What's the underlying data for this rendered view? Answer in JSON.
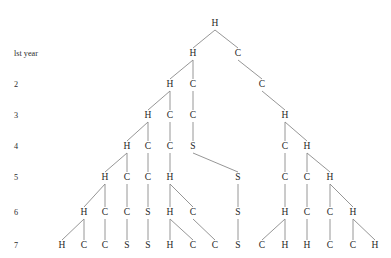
{
  "figure": {
    "type": "tree-diagram",
    "title": "",
    "width": 391,
    "height": 258,
    "background_color": "#ffffff",
    "edge_color": "#8a8a8a",
    "node_text_color": "#262626",
    "label_text_color": "#2b2b2b"
  },
  "row_labels": [
    {
      "text": "lst year",
      "x": 14,
      "y": 54
    },
    {
      "text": "2",
      "x": 14,
      "y": 85
    },
    {
      "text": "3",
      "x": 14,
      "y": 116
    },
    {
      "text": "4",
      "x": 14,
      "y": 147
    },
    {
      "text": "5",
      "x": 14,
      "y": 178
    },
    {
      "text": "6",
      "x": 14,
      "y": 213
    },
    {
      "text": "7",
      "x": 14,
      "y": 246
    }
  ],
  "rows": [
    {
      "level": 0,
      "y": 24
    },
    {
      "level": 1,
      "y": 54
    },
    {
      "level": 2,
      "y": 85
    },
    {
      "level": 3,
      "y": 116
    },
    {
      "level": 4,
      "y": 147
    },
    {
      "level": 5,
      "y": 178
    },
    {
      "level": 6,
      "y": 213
    },
    {
      "level": 7,
      "y": 246
    }
  ],
  "nodes": [
    {
      "id": "n0",
      "label": "H",
      "x": 215,
      "y": 24
    },
    {
      "id": "n1a",
      "label": "H",
      "x": 193,
      "y": 54
    },
    {
      "id": "n1b",
      "label": "C",
      "x": 238,
      "y": 54
    },
    {
      "id": "n2a",
      "label": "H",
      "x": 170,
      "y": 85
    },
    {
      "id": "n2b",
      "label": "C",
      "x": 193,
      "y": 85
    },
    {
      "id": "n2c",
      "label": "C",
      "x": 262,
      "y": 85
    },
    {
      "id": "n3a",
      "label": "H",
      "x": 148,
      "y": 116
    },
    {
      "id": "n3b",
      "label": "C",
      "x": 170,
      "y": 116
    },
    {
      "id": "n3c",
      "label": "C",
      "x": 193,
      "y": 116
    },
    {
      "id": "n3d",
      "label": "H",
      "x": 285,
      "y": 116
    },
    {
      "id": "n4a",
      "label": "H",
      "x": 127,
      "y": 147
    },
    {
      "id": "n4b",
      "label": "C",
      "x": 148,
      "y": 147
    },
    {
      "id": "n4c",
      "label": "C",
      "x": 170,
      "y": 147
    },
    {
      "id": "n4d",
      "label": "S",
      "x": 193,
      "y": 147
    },
    {
      "id": "n4e",
      "label": "C",
      "x": 285,
      "y": 147
    },
    {
      "id": "n4f",
      "label": "H",
      "x": 307,
      "y": 147
    },
    {
      "id": "n5a",
      "label": "H",
      "x": 105,
      "y": 178
    },
    {
      "id": "n5b",
      "label": "C",
      "x": 127,
      "y": 178
    },
    {
      "id": "n5c",
      "label": "C",
      "x": 148,
      "y": 178
    },
    {
      "id": "n5d",
      "label": "H",
      "x": 170,
      "y": 178
    },
    {
      "id": "n5e",
      "label": "S",
      "x": 238,
      "y": 178
    },
    {
      "id": "n5f",
      "label": "C",
      "x": 285,
      "y": 178
    },
    {
      "id": "n5g",
      "label": "C",
      "x": 307,
      "y": 178
    },
    {
      "id": "n5h",
      "label": "H",
      "x": 330,
      "y": 178
    },
    {
      "id": "n6a",
      "label": "H",
      "x": 84,
      "y": 213
    },
    {
      "id": "n6b",
      "label": "C",
      "x": 105,
      "y": 213
    },
    {
      "id": "n6c",
      "label": "C",
      "x": 127,
      "y": 213
    },
    {
      "id": "n6d",
      "label": "S",
      "x": 148,
      "y": 213
    },
    {
      "id": "n6e",
      "label": "H",
      "x": 170,
      "y": 213
    },
    {
      "id": "n6f",
      "label": "C",
      "x": 193,
      "y": 213
    },
    {
      "id": "n6g",
      "label": "S",
      "x": 238,
      "y": 213
    },
    {
      "id": "n6h",
      "label": "H",
      "x": 285,
      "y": 213
    },
    {
      "id": "n6i",
      "label": "C",
      "x": 307,
      "y": 213
    },
    {
      "id": "n6j",
      "label": "C",
      "x": 330,
      "y": 213
    },
    {
      "id": "n6k",
      "label": "H",
      "x": 353,
      "y": 213
    },
    {
      "id": "n7a",
      "label": "H",
      "x": 62,
      "y": 246
    },
    {
      "id": "n7b",
      "label": "C",
      "x": 84,
      "y": 246
    },
    {
      "id": "n7c",
      "label": "C",
      "x": 105,
      "y": 246
    },
    {
      "id": "n7d",
      "label": "S",
      "x": 127,
      "y": 246
    },
    {
      "id": "n7e",
      "label": "S",
      "x": 148,
      "y": 246
    },
    {
      "id": "n7f",
      "label": "H",
      "x": 170,
      "y": 246
    },
    {
      "id": "n7g",
      "label": "C",
      "x": 193,
      "y": 246
    },
    {
      "id": "n7h",
      "label": "C",
      "x": 215,
      "y": 246
    },
    {
      "id": "n7i",
      "label": "S",
      "x": 238,
      "y": 246
    },
    {
      "id": "n7j",
      "label": "C",
      "x": 262,
      "y": 246
    },
    {
      "id": "n7k",
      "label": "H",
      "x": 285,
      "y": 246
    },
    {
      "id": "n7l",
      "label": "H",
      "x": 307,
      "y": 246
    },
    {
      "id": "n7m",
      "label": "C",
      "x": 330,
      "y": 246
    },
    {
      "id": "n7n",
      "label": "C",
      "x": 353,
      "y": 246
    },
    {
      "id": "n7o",
      "label": "H",
      "x": 375,
      "y": 246
    }
  ],
  "edges": [
    {
      "from": "n0",
      "to": "n1a"
    },
    {
      "from": "n0",
      "to": "n1b"
    },
    {
      "from": "n1a",
      "to": "n2a"
    },
    {
      "from": "n1a",
      "to": "n2b"
    },
    {
      "from": "n1b",
      "to": "n2c"
    },
    {
      "from": "n2a",
      "to": "n3a"
    },
    {
      "from": "n2a",
      "to": "n3b"
    },
    {
      "from": "n2b",
      "to": "n3c"
    },
    {
      "from": "n2c",
      "to": "n3d"
    },
    {
      "from": "n3a",
      "to": "n4a"
    },
    {
      "from": "n3a",
      "to": "n4b"
    },
    {
      "from": "n3b",
      "to": "n4c"
    },
    {
      "from": "n3c",
      "to": "n4d"
    },
    {
      "from": "n3d",
      "to": "n4e"
    },
    {
      "from": "n3d",
      "to": "n4f"
    },
    {
      "from": "n4a",
      "to": "n5a"
    },
    {
      "from": "n4a",
      "to": "n5b"
    },
    {
      "from": "n4b",
      "to": "n5c"
    },
    {
      "from": "n4c",
      "to": "n5d"
    },
    {
      "from": "n4d",
      "to": "n5e"
    },
    {
      "from": "n4e",
      "to": "n5f"
    },
    {
      "from": "n4f",
      "to": "n5g"
    },
    {
      "from": "n4f",
      "to": "n5h"
    },
    {
      "from": "n5a",
      "to": "n6a"
    },
    {
      "from": "n5a",
      "to": "n6b"
    },
    {
      "from": "n5b",
      "to": "n6c"
    },
    {
      "from": "n5c",
      "to": "n6d"
    },
    {
      "from": "n5d",
      "to": "n6e"
    },
    {
      "from": "n5d",
      "to": "n6f"
    },
    {
      "from": "n5e",
      "to": "n6g"
    },
    {
      "from": "n5f",
      "to": "n6h"
    },
    {
      "from": "n5g",
      "to": "n6i"
    },
    {
      "from": "n5h",
      "to": "n6j"
    },
    {
      "from": "n5h",
      "to": "n6k"
    },
    {
      "from": "n6a",
      "to": "n7a"
    },
    {
      "from": "n6a",
      "to": "n7b"
    },
    {
      "from": "n6b",
      "to": "n7c"
    },
    {
      "from": "n6c",
      "to": "n7d"
    },
    {
      "from": "n6d",
      "to": "n7e"
    },
    {
      "from": "n6e",
      "to": "n7f"
    },
    {
      "from": "n6e",
      "to": "n7g"
    },
    {
      "from": "n6f",
      "to": "n7h"
    },
    {
      "from": "n6g",
      "to": "n7i"
    },
    {
      "from": "n6h",
      "to": "n7j"
    },
    {
      "from": "n6h",
      "to": "n7k"
    },
    {
      "from": "n6i",
      "to": "n7l"
    },
    {
      "from": "n6j",
      "to": "n7m"
    },
    {
      "from": "n6k",
      "to": "n7n"
    },
    {
      "from": "n6k",
      "to": "n7o"
    }
  ]
}
